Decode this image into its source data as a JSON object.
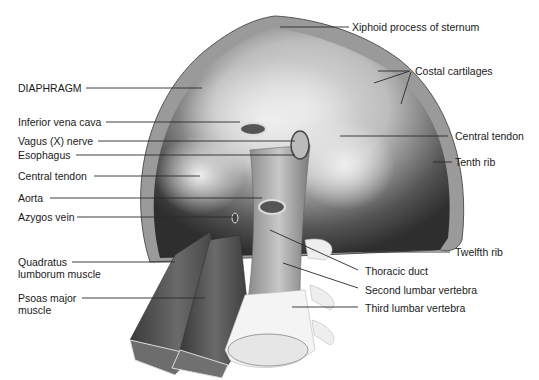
{
  "figure": {
    "colors": {
      "background": "#ffffff",
      "label_text": "#1a1a1a",
      "leader_line": "#2a2a2a",
      "muscle_dark": "#3c3c3c",
      "tendon_light": "#d8d8d8",
      "bone": "#f2f2f2"
    },
    "labels_left": [
      {
        "id": "diaphragm",
        "text": "DIAPHRAGM"
      },
      {
        "id": "ivc",
        "text": "Inferior vena cava"
      },
      {
        "id": "vagus",
        "text": "Vagus (X) nerve"
      },
      {
        "id": "esophagus",
        "text": "Esophagus"
      },
      {
        "id": "central-tendon-left",
        "text": "Central tendon"
      },
      {
        "id": "aorta",
        "text": "Aorta"
      },
      {
        "id": "azygos",
        "text": "Azygos vein"
      },
      {
        "id": "quadratus",
        "text": "Quadratus lumborum muscle"
      },
      {
        "id": "psoas",
        "text": "Psoas major muscle"
      }
    ],
    "labels_right": [
      {
        "id": "xiphoid",
        "text": "Xiphoid process of sternum"
      },
      {
        "id": "costal",
        "text": "Costal cartilages"
      },
      {
        "id": "central-tendon-right",
        "text": "Central tendon"
      },
      {
        "id": "tenth-rib",
        "text": "Tenth rib"
      },
      {
        "id": "twelfth-rib",
        "text": "Twelfth rib"
      },
      {
        "id": "thoracic-duct",
        "text": "Thoracic duct"
      },
      {
        "id": "second-lumbar",
        "text": "Second lumbar vertebra"
      },
      {
        "id": "third-lumbar",
        "text": "Third lumbar vertebra"
      }
    ]
  }
}
